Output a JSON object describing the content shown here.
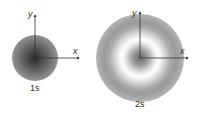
{
  "orbitals": [
    {
      "label": "1s",
      "axis_x": "x",
      "axis_y": "y"
    },
    {
      "label": "2s",
      "axis_x": "x",
      "axis_y": "y"
    }
  ],
  "colors": {
    "axis": "#333333",
    "text": "#333333"
  }
}
